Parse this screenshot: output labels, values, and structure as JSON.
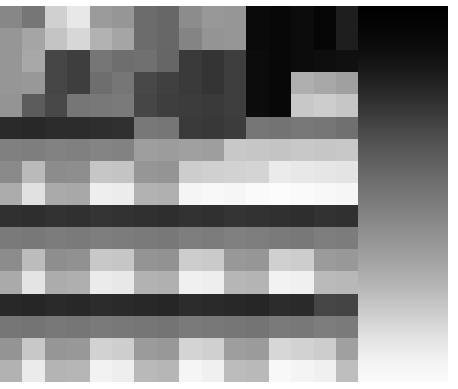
{
  "image": {
    "title": "Pixelated Grayscale Mosaic",
    "description": "Heavily downsampled grayscale photograph rendered as a blocky mosaic of uniform gray tiles",
    "width": 458,
    "height": 389,
    "background_color": "#ffffff",
    "margins": {
      "top": 6,
      "bottom": 7,
      "left": 0,
      "right": 10
    }
  },
  "mosaic": {
    "columns": 20,
    "rows": 17,
    "cell_width": 22.4,
    "cell_height": 22.1,
    "origin_x": 0,
    "origin_y": 6,
    "palette_note": "values are 8-bit gray levels 0-255",
    "gradient_overlay": {
      "enabled": true,
      "region_x": 358,
      "region_y": 6,
      "region_width": 90,
      "region_height": 376,
      "direction": "vertical",
      "stops": [
        "#000000",
        "#050505",
        "#0d0d0d",
        "#1a1a1a",
        "#2b2b2b",
        "#3d3d3d",
        "#4f4f4f",
        "#5f5f5f",
        "#6f6f6f",
        "#7d7d7d",
        "#8c8c8c",
        "#9b9b9b",
        "#aaaaaa",
        "#bcbcbc",
        "#cfcfcf",
        "#e2e2e2",
        "#f2f2f2",
        "#fbfbfb"
      ]
    },
    "grid": [
      [
        135,
        118,
        208,
        232,
        155,
        150,
        108,
        103,
        140,
        152,
        150,
        10,
        8,
        12,
        6,
        30,
        18,
        10,
        8,
        6
      ],
      [
        150,
        165,
        196,
        215,
        178,
        165,
        108,
        103,
        132,
        148,
        150,
        10,
        8,
        12,
        6,
        30,
        18,
        10,
        8,
        6
      ],
      [
        150,
        168,
        70,
        62,
        118,
        110,
        112,
        102,
        58,
        52,
        62,
        12,
        8,
        12,
        14,
        16,
        18,
        10,
        8,
        6
      ],
      [
        150,
        152,
        70,
        62,
        110,
        118,
        72,
        64,
        58,
        52,
        62,
        12,
        8,
        175,
        168,
        160,
        182,
        200,
        8,
        6
      ],
      [
        148,
        92,
        72,
        118,
        120,
        122,
        70,
        62,
        60,
        58,
        62,
        12,
        8,
        200,
        205,
        198,
        215,
        248,
        8,
        6
      ],
      [
        42,
        40,
        44,
        44,
        46,
        48,
        120,
        118,
        58,
        56,
        60,
        118,
        115,
        120,
        118,
        112,
        110,
        108,
        40,
        6
      ],
      [
        128,
        126,
        130,
        128,
        132,
        130,
        158,
        156,
        160,
        158,
        200,
        198,
        196,
        200,
        198,
        200,
        196,
        195,
        62,
        10
      ],
      [
        138,
        186,
        140,
        142,
        198,
        196,
        150,
        148,
        205,
        208,
        210,
        212,
        235,
        232,
        230,
        228,
        226,
        224,
        66,
        22
      ],
      [
        172,
        225,
        170,
        168,
        238,
        236,
        178,
        176,
        245,
        248,
        246,
        250,
        252,
        250,
        248,
        246,
        244,
        240,
        70,
        30
      ],
      [
        48,
        46,
        50,
        48,
        52,
        50,
        48,
        46,
        50,
        48,
        52,
        50,
        48,
        46,
        50,
        48,
        52,
        50,
        82,
        40
      ],
      [
        122,
        120,
        124,
        122,
        126,
        124,
        122,
        120,
        126,
        124,
        128,
        126,
        122,
        120,
        126,
        124,
        128,
        126,
        100,
        55
      ],
      [
        140,
        188,
        142,
        145,
        200,
        198,
        148,
        146,
        205,
        202,
        152,
        150,
        208,
        205,
        155,
        152,
        210,
        206,
        120,
        75
      ],
      [
        170,
        228,
        172,
        175,
        235,
        232,
        178,
        176,
        240,
        238,
        182,
        180,
        242,
        240,
        186,
        184,
        246,
        242,
        140,
        95
      ],
      [
        40,
        38,
        42,
        40,
        44,
        42,
        40,
        38,
        44,
        42,
        40,
        38,
        44,
        42,
        70,
        68,
        44,
        42,
        160,
        115
      ],
      [
        118,
        116,
        120,
        118,
        122,
        120,
        118,
        116,
        122,
        120,
        118,
        116,
        122,
        120,
        125,
        122,
        120,
        118,
        185,
        140
      ],
      [
        148,
        200,
        150,
        152,
        210,
        206,
        155,
        152,
        212,
        208,
        158,
        155,
        215,
        210,
        205,
        160,
        158,
        155,
        205,
        175
      ],
      [
        178,
        235,
        180,
        182,
        242,
        238,
        185,
        182,
        245,
        240,
        188,
        185,
        248,
        244,
        240,
        190,
        188,
        185,
        228,
        215
      ]
    ]
  }
}
